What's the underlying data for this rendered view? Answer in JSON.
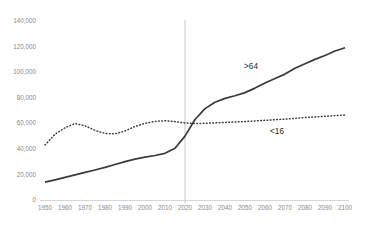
{
  "page": {
    "background": "#ffffff"
  },
  "chart_data": {
    "type": "line",
    "title": "",
    "xlabel": "",
    "ylabel": "",
    "xlim": [
      1950,
      2100
    ],
    "ylim": [
      0,
      140000
    ],
    "grid": "off",
    "legend": "inline-series-labels",
    "colors": {
      "line": "#3a3a3a",
      "tick_label": "#8a8a8a",
      "axis_line": "#d6d6d6",
      "reference_line": "#c9c9c9",
      "annotation_text": "#262626"
    },
    "x_ticks": [
      {
        "v": 1950,
        "label": "1950"
      },
      {
        "v": 1960,
        "label": "1960"
      },
      {
        "v": 1970,
        "label": "1970"
      },
      {
        "v": 1980,
        "label": "1980"
      },
      {
        "v": 1990,
        "label": "1990"
      },
      {
        "v": 2000,
        "label": "2000"
      },
      {
        "v": 2010,
        "label": "2010"
      },
      {
        "v": 2020,
        "label": "2020"
      },
      {
        "v": 2030,
        "label": "2030"
      },
      {
        "v": 2040,
        "label": "2040"
      },
      {
        "v": 2050,
        "label": "2050"
      },
      {
        "v": 2060,
        "label": "2060"
      },
      {
        "v": 2070,
        "label": "2070"
      },
      {
        "v": 2080,
        "label": "2080"
      },
      {
        "v": 2090,
        "label": "2090"
      },
      {
        "v": 2100,
        "label": "2100"
      }
    ],
    "y_ticks": [
      {
        "v": 0,
        "label": "0"
      },
      {
        "v": 20000,
        "label": "20,000"
      },
      {
        "v": 40000,
        "label": "40,000"
      },
      {
        "v": 60000,
        "label": "60,000"
      },
      {
        "v": 80000,
        "label": "80,000"
      },
      {
        "v": 100000,
        "label": "100,000"
      },
      {
        "v": 120000,
        "label": "120,000"
      },
      {
        "v": 140000,
        "label": "140,000"
      }
    ],
    "reference_line": {
      "x": 2020
    },
    "x": [
      1950,
      1955,
      1960,
      1965,
      1970,
      1975,
      1980,
      1985,
      1990,
      1995,
      2000,
      2005,
      2010,
      2015,
      2020,
      2025,
      2030,
      2035,
      2040,
      2045,
      2050,
      2055,
      2060,
      2065,
      2070,
      2075,
      2080,
      2085,
      2090,
      2095,
      2100
    ],
    "series": [
      {
        "name": ">64",
        "style": "solid",
        "values": [
          14000,
          15800,
          17700,
          19600,
          21600,
          23500,
          25500,
          27800,
          30000,
          32000,
          33500,
          34800,
          36500,
          40500,
          50000,
          63000,
          71500,
          76500,
          79500,
          81500,
          84000,
          87500,
          91500,
          95000,
          98500,
          103000,
          106500,
          110000,
          113000,
          116500,
          119000
        ]
      },
      {
        "name": "<16",
        "style": "dotted",
        "values": [
          43000,
          51500,
          56500,
          59800,
          58000,
          54500,
          52000,
          51800,
          54000,
          57500,
          60000,
          61500,
          62000,
          61300,
          60200,
          59800,
          60000,
          60300,
          60700,
          61000,
          61400,
          61800,
          62300,
          62800,
          63300,
          63900,
          64500,
          65000,
          65500,
          66000,
          66500
        ]
      }
    ],
    "annotations": [
      {
        "text": ">64",
        "year": 2053,
        "value": 104500
      },
      {
        "text": "<16",
        "year": 2066,
        "value": 53500
      }
    ]
  }
}
